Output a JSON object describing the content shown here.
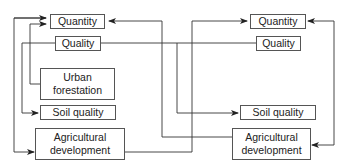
{
  "diagram": {
    "left": {
      "quantity": "Quantity",
      "quality": "Quality",
      "urban_forestation_1": "Urban",
      "urban_forestation_2": "forestation",
      "soil_quality": "Soil quality",
      "agri_dev_1": "Agricultural",
      "agri_dev_2": "development"
    },
    "right": {
      "quantity": "Quantity",
      "quality": "Quality",
      "soil_quality": "Soil quality",
      "agri_dev_1": "Agricultural",
      "agri_dev_2": "development"
    },
    "connections": [
      {
        "from": "left.agricultural_development",
        "to": "left.quantity"
      },
      {
        "from": "left.quantity",
        "to": "left.agricultural_development"
      },
      {
        "from": "left.urban_forestation",
        "to": "left.quantity"
      },
      {
        "from": "left.quality",
        "to": "left.soil_quality"
      },
      {
        "from": "left.quality",
        "to": "right.soil_quality"
      },
      {
        "from": "left.quality",
        "to": "right.quality"
      },
      {
        "from": "right.agricultural_development",
        "to": "left.quantity"
      },
      {
        "from": "left.agricultural_development",
        "to": "right.quantity"
      },
      {
        "from": "right.quality",
        "to": "left.quality"
      },
      {
        "from": "right.quantity",
        "to": "right.agricultural_development"
      },
      {
        "from": "right.agricultural_development",
        "to": "right.quantity"
      }
    ],
    "line_color": "#333333"
  }
}
